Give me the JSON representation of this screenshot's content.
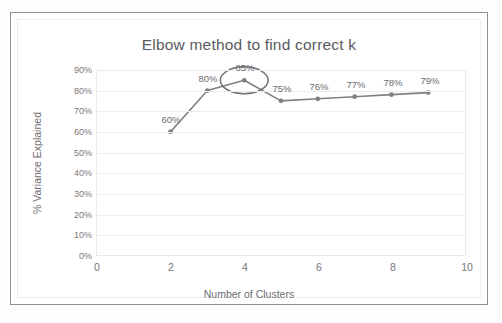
{
  "page": {
    "top_strip_text": "",
    "caption": ""
  },
  "chart_data": {
    "type": "line",
    "title": "Elbow method to find correct k",
    "xlabel": "Number of Clusters",
    "ylabel": "% Variance Explained",
    "x": [
      2,
      3,
      4,
      5,
      6,
      7,
      8,
      9
    ],
    "values": [
      60,
      80,
      85,
      75,
      76,
      77,
      78,
      79
    ],
    "point_labels": [
      "60%",
      "80%",
      "85%",
      "75%",
      "76%",
      "77%",
      "78%",
      "79%"
    ],
    "xlim": [
      0,
      10
    ],
    "ylim": [
      0,
      90
    ],
    "xticks": [
      0,
      2,
      4,
      6,
      8,
      10
    ],
    "xtick_labels": [
      "0",
      "2",
      "4",
      "6",
      "8",
      "10"
    ],
    "yticks": [
      0,
      10,
      20,
      30,
      40,
      50,
      60,
      70,
      80,
      90
    ],
    "ytick_labels": [
      "0%",
      "10%",
      "20%",
      "30%",
      "40%",
      "50%",
      "60%",
      "70%",
      "80%",
      "90%"
    ],
    "grid": "horizontal",
    "legend": "none",
    "series_color": "#808084",
    "marker": "circle",
    "annotations": [
      {
        "kind": "ellipse",
        "target_x": 4,
        "target_y": 85,
        "label": "85%",
        "note": "elbow point circled"
      }
    ]
  }
}
